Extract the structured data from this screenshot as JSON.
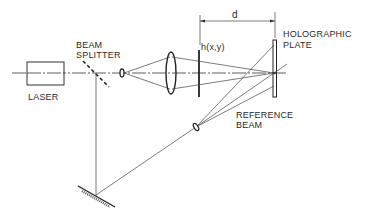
{
  "diagram": {
    "labels": {
      "laser": "LASER",
      "beam_splitter_line1": "BEAM",
      "beam_splitter_line2": "SPLITTER",
      "object": "h(x,y)",
      "distance": "d",
      "plate_line1": "HOLOGRAPHIC",
      "plate_line2": "PLATE",
      "reference_line1": "REFERENCE",
      "reference_line2": "BEAM"
    },
    "components": [
      "laser",
      "beam-splitter",
      "beam-expander-lens",
      "collimating-lens",
      "object-transparency",
      "holographic-plate",
      "mirror",
      "reference-beam-lens"
    ],
    "colors": {
      "ink": "#2a2a2a",
      "background": "#ffffff"
    }
  }
}
